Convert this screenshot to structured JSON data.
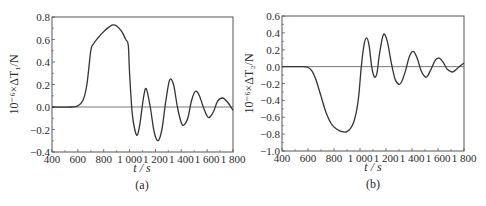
{
  "chart_data": [
    {
      "type": "line",
      "panel_label": "(a)",
      "title": "",
      "xlabel": "t / s",
      "ylabel": "10⁻⁶×ΔT₁/N",
      "xlim": [
        400,
        1800
      ],
      "ylim": [
        -0.4,
        0.8
      ],
      "xticks": [
        400,
        600,
        800,
        1000,
        1200,
        1400,
        1600,
        1800
      ],
      "xtick_labels": [
        "400",
        "600",
        "800",
        "1 000",
        "1 200",
        "1 400",
        "1 600",
        "1 800"
      ],
      "yticks": [
        -0.4,
        -0.2,
        0.0,
        0.2,
        0.4,
        0.6,
        0.8
      ],
      "ytick_labels": [
        "−0.4",
        "−0.2",
        "0.0",
        "0.2",
        "0.4",
        "0.6",
        "0.8"
      ],
      "grid": false,
      "zero_line": true,
      "series": [
        {
          "name": "ΔT1",
          "color": "#333333",
          "x": [
            400,
            550,
            600,
            640,
            670,
            700,
            720,
            760,
            800,
            840,
            870,
            900,
            940,
            970,
            990,
            1000,
            1020,
            1040,
            1060,
            1080,
            1110,
            1130,
            1160,
            1190,
            1220,
            1250,
            1280,
            1310,
            1340,
            1370,
            1400,
            1420,
            1450,
            1480,
            1510,
            1540,
            1570,
            1600,
            1620,
            1650,
            1680,
            1720,
            1760,
            1800
          ],
          "values": [
            0.0,
            0.0,
            0.01,
            0.06,
            0.2,
            0.5,
            0.56,
            0.62,
            0.67,
            0.71,
            0.73,
            0.72,
            0.67,
            0.6,
            0.55,
            0.3,
            -0.05,
            -0.2,
            -0.25,
            -0.15,
            0.1,
            0.16,
            0.0,
            -0.22,
            -0.3,
            -0.2,
            0.05,
            0.24,
            0.2,
            0.0,
            -0.14,
            -0.16,
            -0.1,
            0.06,
            0.14,
            0.1,
            0.0,
            -0.08,
            -0.09,
            -0.04,
            0.05,
            0.08,
            0.04,
            -0.03
          ]
        }
      ]
    },
    {
      "type": "line",
      "panel_label": "(b)",
      "title": "",
      "xlabel": "t / s",
      "ylabel": "10⁻⁶×ΔT₂/N",
      "xlim": [
        400,
        1800
      ],
      "ylim": [
        -1.0,
        0.6
      ],
      "xticks": [
        400,
        600,
        800,
        1000,
        1200,
        1400,
        1600,
        1800
      ],
      "xtick_labels": [
        "400",
        "600",
        "800",
        "1 000",
        "1 200",
        "1 400",
        "1 600",
        "1 800"
      ],
      "yticks": [
        -1.0,
        -0.8,
        -0.6,
        -0.4,
        -0.2,
        0.0,
        0.2,
        0.4,
        0.6
      ],
      "ytick_labels": [
        "−1.0",
        "−0.8",
        "−0.6",
        "−0.4",
        "−0.2",
        "0.0",
        "0.2",
        "0.4",
        "0.6"
      ],
      "grid": false,
      "zero_line": true,
      "series": [
        {
          "name": "ΔT2",
          "color": "#333333",
          "x": [
            400,
            560,
            600,
            630,
            660,
            700,
            740,
            780,
            820,
            860,
            900,
            940,
            970,
            990,
            1010,
            1030,
            1050,
            1070,
            1090,
            1110,
            1130,
            1150,
            1180,
            1210,
            1240,
            1270,
            1300,
            1320,
            1350,
            1380,
            1410,
            1440,
            1470,
            1500,
            1520,
            1550,
            1580,
            1610,
            1640,
            1670,
            1700,
            1720,
            1750,
            1780,
            1800
          ],
          "values": [
            0.0,
            0.0,
            -0.01,
            -0.05,
            -0.15,
            -0.35,
            -0.55,
            -0.68,
            -0.74,
            -0.77,
            -0.77,
            -0.7,
            -0.55,
            -0.35,
            0.0,
            0.25,
            0.34,
            0.25,
            0.0,
            -0.12,
            -0.08,
            0.15,
            0.38,
            0.3,
            0.05,
            -0.15,
            -0.21,
            -0.18,
            -0.05,
            0.12,
            0.18,
            0.1,
            -0.05,
            -0.12,
            -0.11,
            -0.02,
            0.08,
            0.1,
            0.05,
            -0.03,
            -0.06,
            -0.06,
            -0.02,
            0.02,
            0.04
          ]
        }
      ]
    }
  ]
}
